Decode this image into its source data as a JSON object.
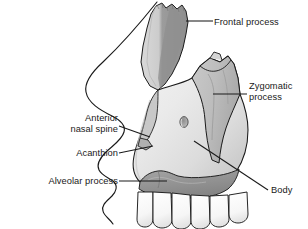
{
  "figure": {
    "width": 308,
    "height": 229,
    "background_color": "#ffffff"
  },
  "labels": [
    {
      "id": "frontal-process",
      "text": "Frontal process",
      "side": "right",
      "leader": {
        "from_x": 214,
        "from_y": 21,
        "to_x": 186,
        "to_y": 21
      }
    },
    {
      "id": "zygomatic-process",
      "text": "Zygomatic\nprocess",
      "line1": "Zygomatic",
      "line2": "process",
      "side": "right",
      "leader": {
        "from_x": 247,
        "from_y": 94,
        "to_x": 213,
        "to_y": 94
      }
    },
    {
      "id": "anterior-nasal-spine",
      "text": "Anterior\nnasal spine",
      "line1": "Anterior",
      "line2": "nasal spine",
      "side": "left",
      "leader": {
        "from_x": 119,
        "from_y": 126,
        "to_x": 148,
        "to_y": 136
      }
    },
    {
      "id": "acanthion",
      "text": "Acanthion",
      "side": "left",
      "leader": {
        "from_x": 119,
        "from_y": 153,
        "to_x": 152,
        "to_y": 146
      }
    },
    {
      "id": "alveolar-process",
      "text": "Alveolar process",
      "side": "left",
      "leader": {
        "from_x": 119,
        "from_y": 181,
        "to_x": 167,
        "to_y": 181
      }
    },
    {
      "id": "body",
      "text": "Body",
      "side": "right",
      "leader": {
        "from_x": 269,
        "from_y": 190,
        "to_x": 194,
        "to_y": 141
      }
    }
  ],
  "colors": {
    "outline": "#1a1a1a",
    "bone_light": "#e9e9e9",
    "bone_mid": "#cfcfcf",
    "bone_dark": "#9a9a9a",
    "bone_darker": "#7d7d7d",
    "tooth": "#fbfbfb",
    "leader_line": "#1a1a1a",
    "label_text": "#1a1a1a",
    "soft_tissue": "#ffffff"
  },
  "anatomy_parts": [
    {
      "id": "frontal-process",
      "name": "Frontal process",
      "shade": "bone_dark"
    },
    {
      "id": "zygomatic-process",
      "name": "Zygomatic process",
      "shade": "bone_mid"
    },
    {
      "id": "body",
      "name": "Body",
      "shade": "bone_light"
    },
    {
      "id": "alveolar-process",
      "name": "Alveolar process",
      "shade": "bone_darker"
    },
    {
      "id": "anterior-nasal-spine",
      "name": "Anterior nasal spine",
      "shade": "bone_mid"
    },
    {
      "id": "acanthion",
      "name": "Acanthion",
      "shade": "bone_mid"
    },
    {
      "id": "infraorbital-foramen",
      "name": "Infraorbital foramen",
      "shade": "bone_dark"
    }
  ],
  "teeth": {
    "count": 6,
    "label": "maxillary teeth"
  },
  "profile": {
    "name": "facial soft tissue profile"
  }
}
